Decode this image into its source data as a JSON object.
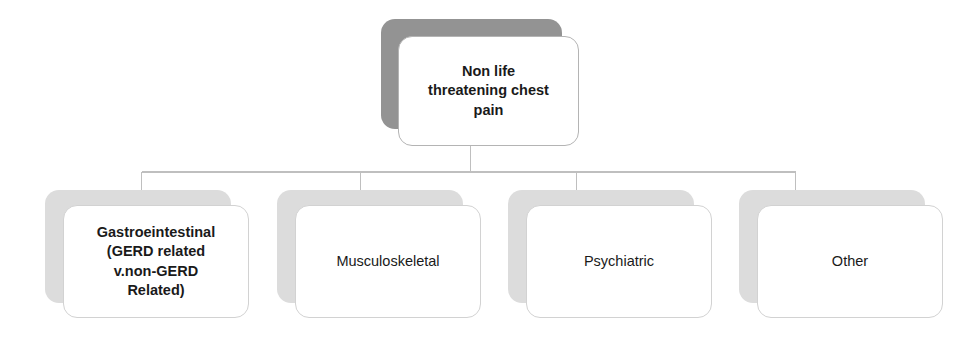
{
  "diagram": {
    "type": "flowchart",
    "orientation": "top-down",
    "title_node": "root",
    "connector_color": "#bfbfbf",
    "root_shadow_color": "#939393",
    "child_shadow_color": "#dcdcdc",
    "card_background": "#ffffff",
    "text_color": "#1a1a1a",
    "nodes": {
      "root": {
        "id": "root",
        "label": "Non life\nthreatening chest\npain",
        "level": 0
      },
      "children": [
        {
          "id": "gastrointestinal",
          "label": "Gastroeintestinal\n(GERD related\nv.non-GERD\nRelated)",
          "level": 1
        },
        {
          "id": "musculoskeletal",
          "label": "Musculoskeletal",
          "level": 1
        },
        {
          "id": "psychiatric",
          "label": "Psychiatric",
          "level": 1
        },
        {
          "id": "other",
          "label": "Other",
          "level": 1
        }
      ]
    },
    "edges": [
      {
        "from": "root",
        "to": "gastrointestinal"
      },
      {
        "from": "root",
        "to": "musculoskeletal"
      },
      {
        "from": "root",
        "to": "psychiatric"
      },
      {
        "from": "root",
        "to": "other"
      }
    ]
  }
}
